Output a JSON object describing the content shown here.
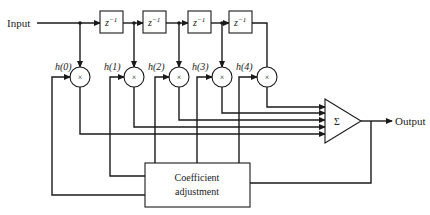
{
  "diagram": {
    "type": "adaptive FIR filter block diagram",
    "input_label": "Input",
    "output_label": "Output",
    "delay_label_base": "z",
    "delay_label_exp": "−1",
    "delays": [
      {
        "id": "z1"
      },
      {
        "id": "z2"
      },
      {
        "id": "z3"
      },
      {
        "id": "z4"
      }
    ],
    "multiplier_symbol": "×",
    "coefficients": [
      "h(0)",
      "h(1)",
      "h(2)",
      "h(3)",
      "h(4)"
    ],
    "summer_symbol": "Σ",
    "adjust_block": {
      "line1": "Coefficient",
      "line2": "adjustment"
    },
    "colors": {
      "stroke": "#1a1a1a",
      "background": "#ffffff"
    }
  }
}
